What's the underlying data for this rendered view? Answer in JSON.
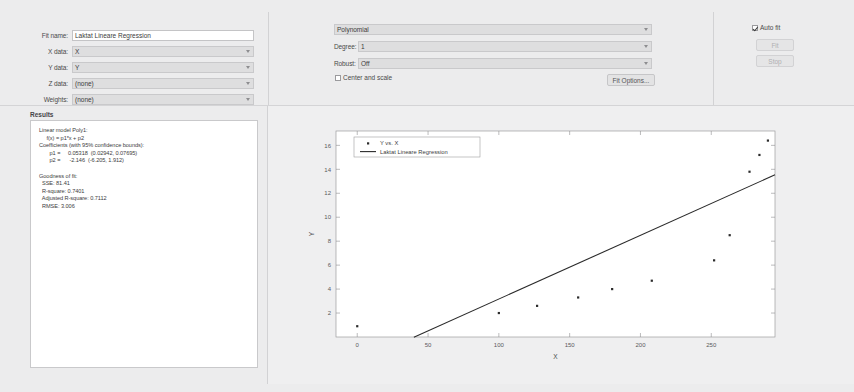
{
  "app": {
    "name": "Curve Fitting Tool"
  },
  "data_panel": {
    "fields": [
      {
        "label": "Fit name:",
        "type": "text",
        "value": "Laktat Lineare Regression"
      },
      {
        "label": "X data:",
        "type": "combo",
        "value": "X"
      },
      {
        "label": "Y data:",
        "type": "combo",
        "value": "Y"
      },
      {
        "label": "Z data:",
        "type": "combo",
        "value": "(none)"
      },
      {
        "label": "Weights:",
        "type": "combo",
        "value": "(none)"
      }
    ]
  },
  "fit_panel": {
    "fit_type": "Polynomial",
    "degree_label": "Degree:",
    "degree_value": "1",
    "robust_label": "Robust:",
    "robust_value": "Off",
    "center_and_scale_label": "Center and scale",
    "center_and_scale_checked": false,
    "fit_options_label": "Fit Options..."
  },
  "controls_panel": {
    "auto_fit_label": "Auto fit",
    "auto_fit_checked": true,
    "fit_button_label": "Fit",
    "stop_button_label": "Stop"
  },
  "results": {
    "label": "Results",
    "text": "Linear model Poly1:\n     f(x) = p1*x + p2\nCoefficients (with 95% confidence bounds):\n       p1 =     0.05318  (0.02942, 0.07695)\n       p2 =      -2.146  (-6.205, 1.912)\n\nGoodness of fit:\n  SSE: 81.41\n  R-square: 0.7401\n  Adjusted R-square: 0.7112\n  RMSE: 3.006"
  },
  "chart_data": {
    "type": "scatter",
    "title": "",
    "xlabel": "X",
    "ylabel": "Y",
    "xlim": [
      -15,
      295
    ],
    "ylim": [
      0,
      17.2
    ],
    "xticks": [
      0,
      50,
      100,
      150,
      200,
      250
    ],
    "yticks": [
      2,
      4,
      6,
      8,
      10,
      12,
      14,
      16
    ],
    "grid": false,
    "legend_position": "upper-left",
    "series": [
      {
        "name": "Y vs. X",
        "type": "scatter",
        "marker": "dot",
        "color": "#2a2a2a",
        "points": [
          {
            "x": 0,
            "y": 0.9
          },
          {
            "x": 100,
            "y": 2.0
          },
          {
            "x": 127,
            "y": 2.6
          },
          {
            "x": 156,
            "y": 3.3
          },
          {
            "x": 180,
            "y": 4.0
          },
          {
            "x": 208,
            "y": 4.7
          },
          {
            "x": 252,
            "y": 6.4
          },
          {
            "x": 263,
            "y": 8.5
          },
          {
            "x": 277,
            "y": 13.8
          },
          {
            "x": 284,
            "y": 15.2
          },
          {
            "x": 290,
            "y": 16.4
          }
        ]
      },
      {
        "name": "Laktat Lineare Regression",
        "type": "line",
        "color": "#2a2a2a",
        "slope": 0.05318,
        "intercept": -2.146,
        "x_range": [
          40,
          295
        ]
      }
    ]
  }
}
